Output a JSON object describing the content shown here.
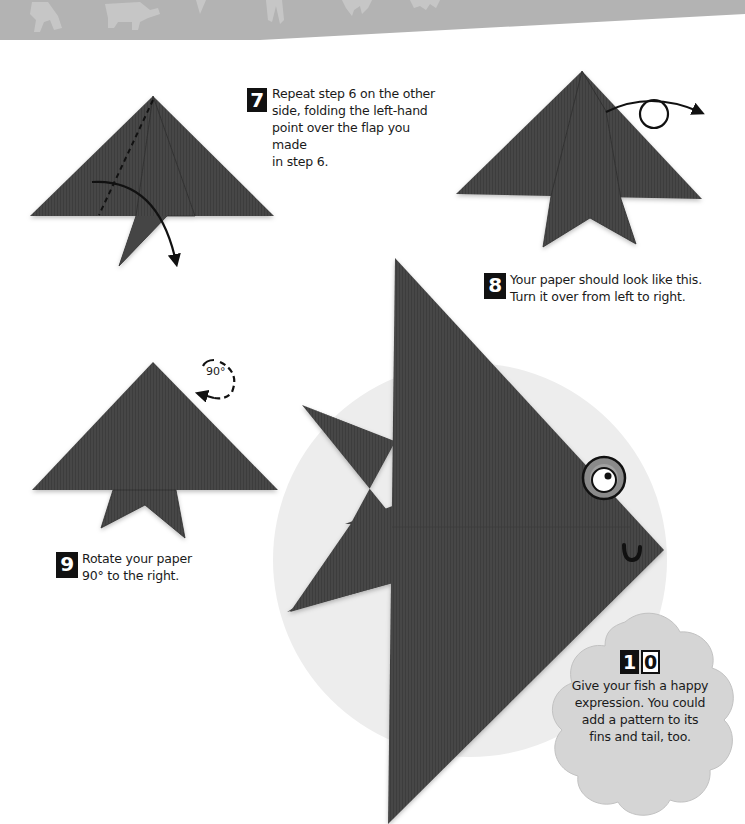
{
  "page": {
    "banner": {
      "description": "grey header band with faint origami animal silhouettes",
      "color": "#b5b5b5"
    },
    "colors": {
      "paper": "#454545",
      "paper_dark": "#3a3a3a",
      "circle_bg": "#ececec",
      "badge_bg": "#d6d6d6",
      "ink": "#111111"
    }
  },
  "steps": [
    {
      "number": "7",
      "lines": [
        "Repeat step 6 on the other",
        "side, folding the left-hand",
        "point over the flap you made",
        "in step 6."
      ],
      "illustration": "fold-diagram-dashed-line-with-curved-arrow"
    },
    {
      "number": "8",
      "lines": [
        "Your paper should look like this.",
        "Turn it over from left to right."
      ],
      "illustration": "folded-shape-with-turn-over-arrow"
    },
    {
      "number": "9",
      "lines": [
        "Rotate your paper",
        "90° to the right."
      ],
      "illustration": "folded-shape-with-rotate-arrow",
      "rotation_label": "90°"
    },
    {
      "number": "10",
      "number_digits": [
        "1",
        "0"
      ],
      "lines": [
        "Give your fish a happy",
        "expression. You could",
        "add a pattern to its",
        "fins and tail, too."
      ],
      "illustration": "finished-origami-fish-with-eye-and-smile"
    }
  ]
}
